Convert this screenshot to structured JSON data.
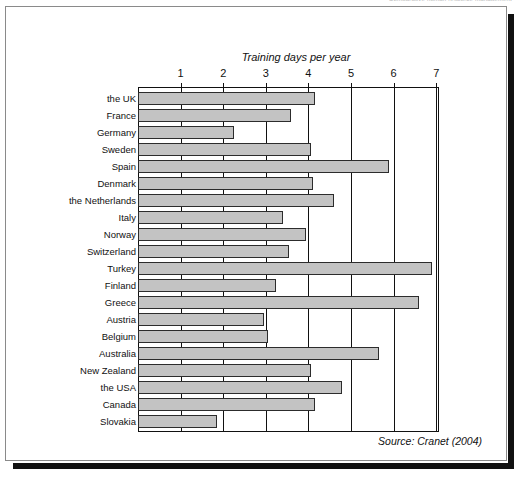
{
  "running_head": "Comparative human resource management",
  "figure": {
    "source_note": "Source: Cranet (2004)"
  },
  "colors": {
    "bar_fill": "#c3c3c3",
    "bar_stroke": "#2c2c2c",
    "axis": "#111111",
    "page_background": "#ffffff"
  },
  "chart_data": {
    "type": "bar",
    "orientation": "horizontal",
    "title": "",
    "xlabel": "Training days per year",
    "ylabel": "",
    "xlim": [
      0,
      7
    ],
    "xticks": [
      1,
      2,
      3,
      4,
      5,
      6,
      7
    ],
    "xtick_labels": [
      "1",
      "2",
      "3",
      "4",
      "5",
      "6",
      "7"
    ],
    "grid": true,
    "legend": false,
    "categories": [
      "the UK",
      "France",
      "Germany",
      "Sweden",
      "Spain",
      "Denmark",
      "the Netherlands",
      "Italy",
      "Norway",
      "Switzerland",
      "Turkey",
      "Finland",
      "Greece",
      "Austria",
      "Belgium",
      "Australia",
      "New Zealand",
      "the USA",
      "Canada",
      "Slovakia"
    ],
    "values": [
      4.15,
      3.6,
      2.25,
      4.05,
      5.9,
      4.1,
      4.6,
      3.4,
      3.95,
      3.55,
      6.9,
      3.25,
      6.6,
      2.95,
      3.05,
      5.65,
      4.05,
      4.8,
      4.15,
      1.85
    ],
    "annotations": [
      "Source: Cranet (2004)"
    ]
  }
}
